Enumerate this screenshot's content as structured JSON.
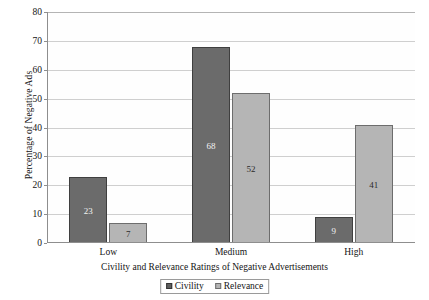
{
  "chart_data": {
    "type": "bar",
    "title": "",
    "xlabel": "Civility and Relevance Ratings of Negative Advertisements",
    "ylabel": "Percentage of Negative Ads",
    "categories": [
      "Low",
      "Medium",
      "High"
    ],
    "series": [
      {
        "name": "Civility",
        "values": [
          23,
          68,
          9
        ],
        "color": "#6b6b6b"
      },
      {
        "name": "Relevance",
        "values": [
          7,
          52,
          41
        ],
        "color": "#b5b5b5"
      }
    ],
    "ylim": [
      0,
      80
    ],
    "ytick_step": 10,
    "yticks": [
      0,
      10,
      20,
      30,
      40,
      50,
      60,
      70,
      80
    ],
    "ytick_labels": [
      "0",
      "10",
      "20",
      "30",
      "40",
      "50",
      "60",
      "70",
      "80"
    ],
    "grid": true,
    "grid_axis": "y",
    "legend_position": "bottom",
    "data_labels": true
  },
  "legend": {
    "items": [
      {
        "label": "Civility"
      },
      {
        "label": "Relevance"
      }
    ]
  }
}
